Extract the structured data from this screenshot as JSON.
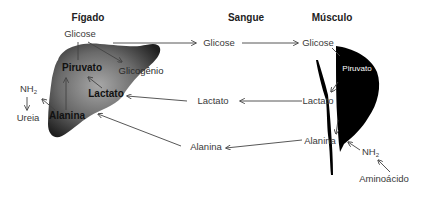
{
  "headers": {
    "liver": "Fígado",
    "blood": "Sangue",
    "muscle": "Músculo"
  },
  "liver": {
    "glucose": "Glicose",
    "pyruvate": "Piruvato",
    "glycogen": "Glicogênio",
    "lactate": "Lactato",
    "alanine": "Alanina",
    "nh2": "NH",
    "nh2_sub": "2",
    "urea": "Ureia"
  },
  "blood": {
    "glucose": "Glicose",
    "lactate": "Lactato",
    "alanine": "Alanina"
  },
  "muscle": {
    "glucose": "Glicose",
    "pyruvate": "Piruvato",
    "lactate": "Lactato",
    "alanine": "Alanina",
    "nh2": "NH",
    "nh2_sub": "2",
    "amino_acid": "Aminoácido"
  },
  "colors": {
    "liver_dark": "#2a2a2a",
    "liver_mid": "#6e6e6e",
    "liver_light": "#9a9a9a",
    "muscle": "#000000",
    "arrow": "#444444",
    "text": "#3a3a3a"
  }
}
